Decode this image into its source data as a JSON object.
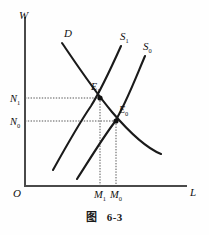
{
  "figure": {
    "caption_word": "图",
    "caption_number": "6-3",
    "background_color": "#fefefe",
    "ink_color": "#111111",
    "axis_color": "#4a4a4a",
    "guide_color": "#555555"
  },
  "axes": {
    "y_label": "W",
    "x_label": "L",
    "origin_label": "O",
    "x_axis_y": 186,
    "y_axis_x": 25,
    "y_axis_top": 18,
    "x_axis_right": 186
  },
  "curves": [
    {
      "id": "demand",
      "label": "D",
      "label_x": 64,
      "label_y": 37,
      "path": "M 62 43 C 75 62, 92 88, 112 112 C 130 133, 146 148, 161 154"
    },
    {
      "id": "supply-1",
      "label": "S",
      "label_sub": "1",
      "label_x": 120,
      "label_y": 40,
      "path": "M 53 170 C 63 152, 78 125, 91 106 C 101 90, 112 66, 121 46"
    },
    {
      "id": "supply-0",
      "label": "S",
      "label_sub": "0",
      "label_x": 143,
      "label_y": 50,
      "path": "M 77 179 C 88 162, 102 139, 114 123 C 125 106, 136 77, 145 56"
    }
  ],
  "equilibria": [
    {
      "id": "e1",
      "label": "E",
      "label_sub": "1",
      "x": 100,
      "y": 98,
      "label_x": 91,
      "label_y": 90,
      "wage_tick": "N",
      "wage_tick_sub": "1",
      "labor_tick": "M",
      "labor_tick_sub": "1"
    },
    {
      "id": "e0",
      "label": "E",
      "label_sub": "0",
      "x": 116,
      "y": 121,
      "label_x": 119,
      "label_y": 113,
      "wage_tick": "N",
      "wage_tick_sub": "0",
      "labor_tick": "M",
      "labor_tick_sub": "0"
    }
  ],
  "y_ticks": [
    {
      "label": "N",
      "sub": "1",
      "y": 98,
      "text_x": 10,
      "text_y": 102
    },
    {
      "label": "N",
      "sub": "0",
      "y": 121,
      "text_x": 10,
      "text_y": 125
    }
  ],
  "x_ticks": [
    {
      "label": "M",
      "sub": "1",
      "x": 100,
      "text_x": 94,
      "text_y": 198
    },
    {
      "label": "M",
      "sub": "0",
      "x": 116,
      "text_x": 110,
      "text_y": 198
    }
  ]
}
